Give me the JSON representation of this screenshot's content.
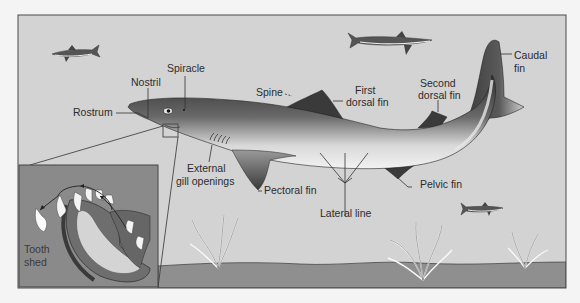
{
  "diagram": {
    "labels": {
      "rostrum": "Rostrum",
      "nostril": "Nostril",
      "spiracle": "Spiracle",
      "spine": "Spine",
      "first_dorsal_1": "First",
      "first_dorsal_2": "dorsal fin",
      "second_dorsal_1": "Second",
      "second_dorsal_2": "dorsal fin",
      "caudal_1": "Caudal",
      "caudal_2": "fin",
      "gill_1": "External",
      "gill_2": "gill openings",
      "pectoral": "Pectoral fin",
      "pelvic": "Pelvic fin",
      "lateral": "Lateral line",
      "tooth_1": "Tooth",
      "tooth_2": "shed"
    },
    "colors": {
      "water": "#d3d3d3",
      "seabed": "#8f8f8f",
      "inset_bg": "#8a8a8a",
      "shark_dark": "#3a3a3a",
      "shark_light": "#e8e8e8",
      "frame": "#4a4a4a"
    }
  }
}
